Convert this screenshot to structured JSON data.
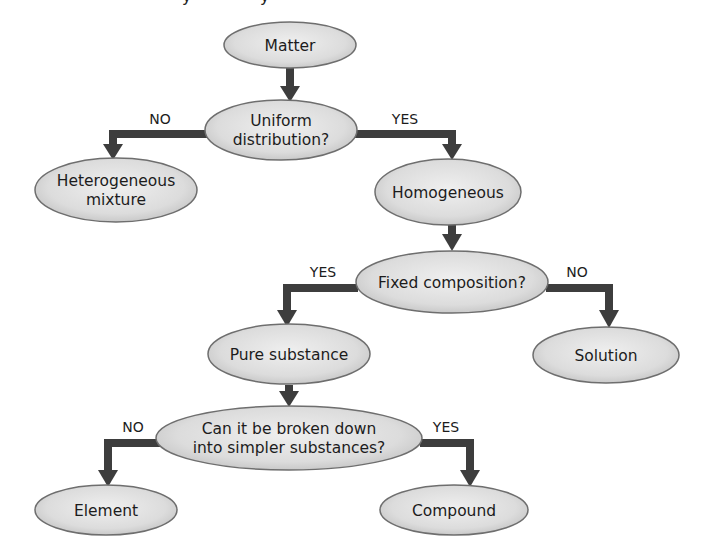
{
  "diagram": {
    "title_fragment": "y          y",
    "colors": {
      "node_fill_light": "#eeeeee",
      "node_fill_dark": "#c4c4c4",
      "node_stroke": "#6e6e6e",
      "connector": "#3d3d3d",
      "text": "#1c1c1c",
      "background": "#ffffff"
    },
    "nodes": {
      "matter": {
        "lines": [
          "Matter"
        ]
      },
      "uniform": {
        "lines": [
          "Uniform",
          "distribution?"
        ]
      },
      "heterogeneous": {
        "lines": [
          "Heterogeneous",
          "mixture"
        ]
      },
      "homogeneous": {
        "lines": [
          "Homogeneous"
        ]
      },
      "fixed": {
        "lines": [
          "Fixed composition?"
        ]
      },
      "pure": {
        "lines": [
          "Pure substance"
        ]
      },
      "solution": {
        "lines": [
          "Solution"
        ]
      },
      "broken": {
        "lines": [
          "Can it be broken down",
          "into simpler substances?"
        ]
      },
      "element": {
        "lines": [
          "Element"
        ]
      },
      "compound": {
        "lines": [
          "Compound"
        ]
      }
    },
    "edges": {
      "uniform_no": "NO",
      "uniform_yes": "YES",
      "fixed_yes": "YES",
      "fixed_no": "NO",
      "broken_no": "NO",
      "broken_yes": "YES"
    }
  }
}
